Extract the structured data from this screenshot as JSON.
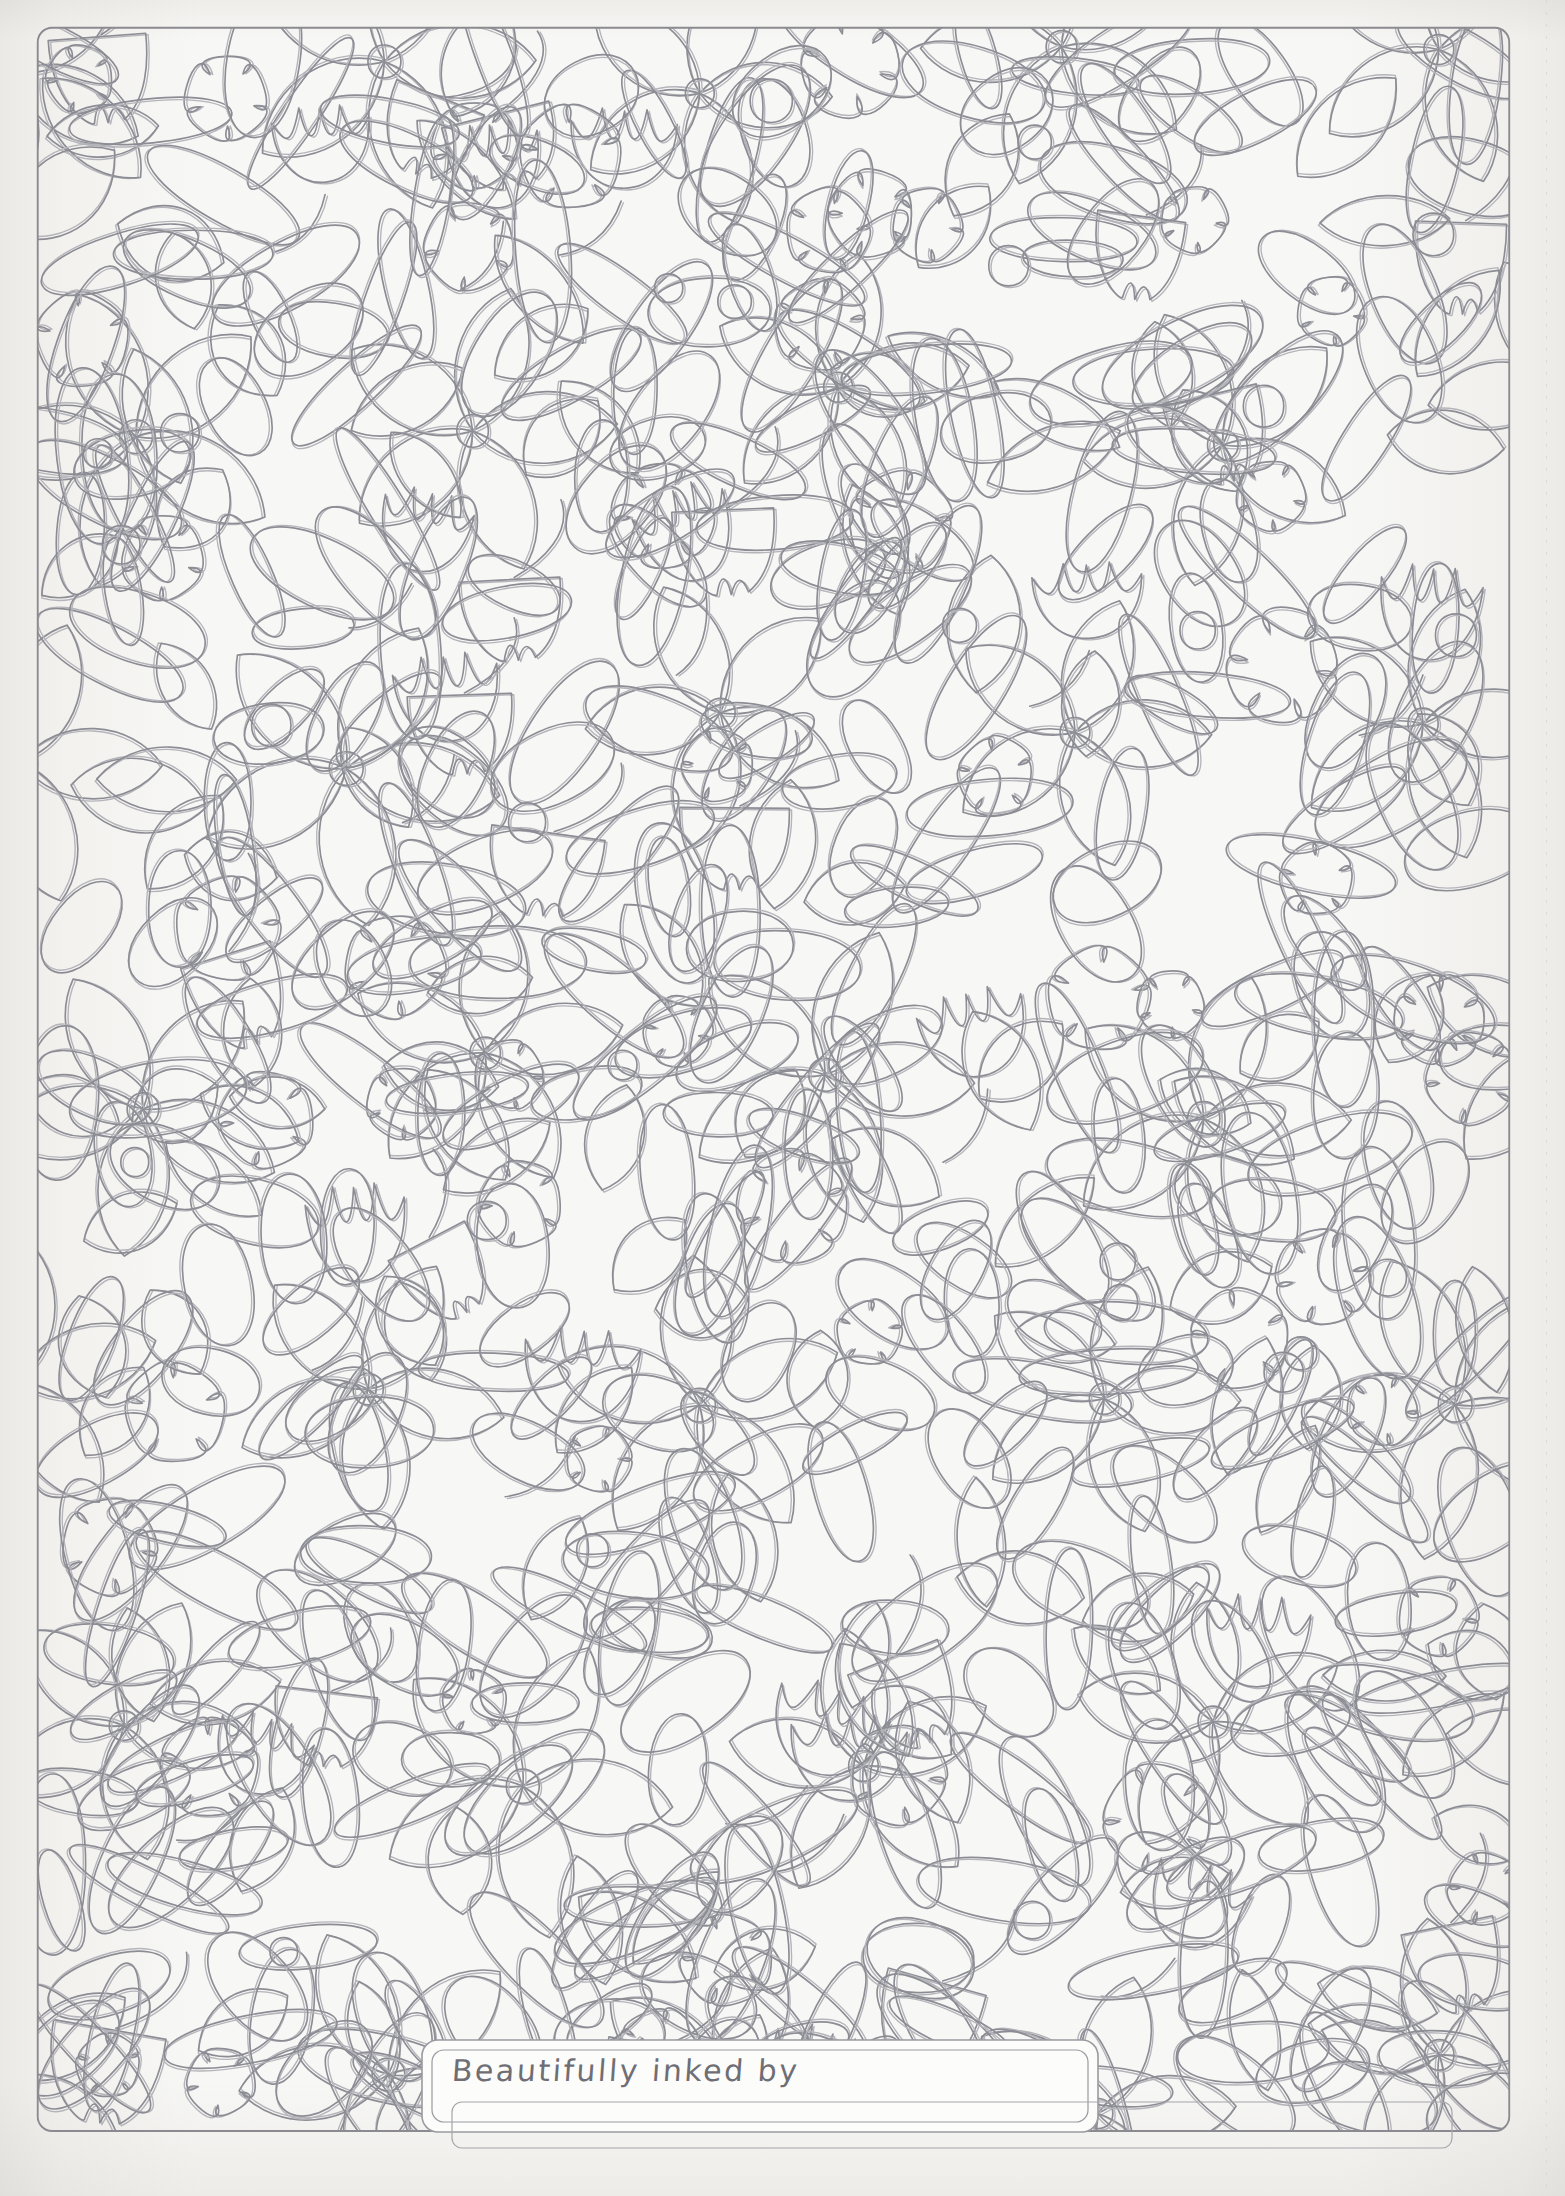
{
  "page": {
    "title": "Beautifully inked by",
    "kind": "floral-doodle-coloring-page",
    "width": 1565,
    "height": 2196,
    "paper_color": "#fbfbfa",
    "margin_color": "#f1f0ee",
    "line_color": "#8e8e96",
    "line_color_light": "#a9a9b0"
  },
  "border": {
    "name": "rounded-page-border",
    "stroke": "#8a8a90",
    "radius": 14,
    "left": 36,
    "top": 26,
    "right": 1530,
    "bottom": 2133
  },
  "signature_box": {
    "label": "Beautifully inked by",
    "stroke": "#9a9aa0",
    "left": 422,
    "top": 2040,
    "width": 676,
    "height": 92,
    "radius": 16
  },
  "secondary_box": {
    "name": "lower-clipped-box",
    "stroke": "#a6a6ac",
    "left": 452,
    "top": 2102,
    "width": 1000,
    "height": 46
  },
  "motifs": [
    {
      "name": "oval-petal",
      "count": 420,
      "description": "elongated ellipse outline, random rotation"
    },
    {
      "name": "teardrop-petal",
      "count": 95,
      "description": "egg / teardrop outline"
    },
    {
      "name": "five-petal-blob",
      "count": 46,
      "description": "cloud-like 5-lobed flower"
    },
    {
      "name": "daisy",
      "count": 14,
      "description": "5 teardrop petals around a small ring center"
    },
    {
      "name": "tulip",
      "count": 16,
      "description": "cup bloom with curved stem"
    },
    {
      "name": "bell-flower",
      "count": 18,
      "description": "drooping scalloped bell with curved stem"
    }
  ],
  "palette": {
    "ink": "#8e8e96",
    "ink_soft": "#b2b2b8",
    "paper": "#fbfbfa",
    "surround": "#f1f0ee"
  }
}
